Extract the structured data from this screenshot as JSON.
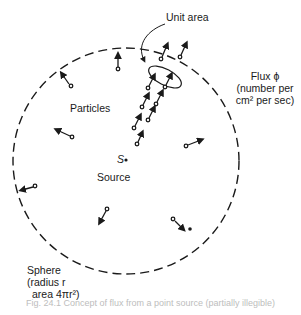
{
  "figure": {
    "type": "diagram",
    "labels": {
      "unit_area": "Unit area",
      "flux_line1": "Flux ϕ",
      "flux_line2": "(number per",
      "flux_line3": "cm² per sec)",
      "particles": "Particles",
      "source_symbol": "S",
      "source": "Source",
      "sphere_line1": "Sphere",
      "sphere_line2": "(radius r",
      "sphere_line3": "area 4πr²)"
    },
    "caption": "Fig. 24.1  Concept of flux from a point source (partially illegible)",
    "sphere": {
      "cx": 126,
      "cy": 161,
      "r": 113,
      "style": "dashed"
    },
    "colors": {
      "ink": "#1a1a1a",
      "background": "#ffffff"
    }
  }
}
